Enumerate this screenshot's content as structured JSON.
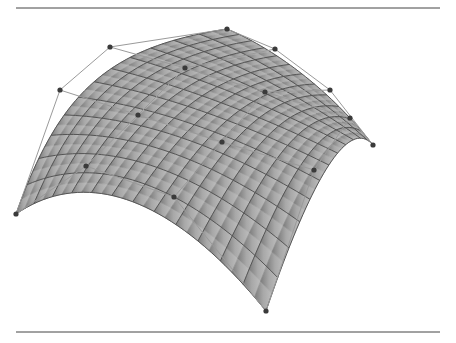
{
  "figure": {
    "rules": {
      "top_y": 8,
      "bottom_y": 332,
      "x1": 16,
      "x2": 440,
      "color": "#444444"
    },
    "colors": {
      "surface": "#a8a8a8",
      "surface_dark": "#7c7c7c",
      "grid": "#555555",
      "net": "#9a9a9a",
      "point": "#3a3a3a"
    },
    "control_net": [
      [
        [
          16,
          214
        ],
        [
          86,
          166
        ],
        [
          174,
          197
        ],
        [
          266,
          311
        ]
      ],
      [
        [
          60,
          90
        ],
        [
          138,
          115
        ],
        [
          222,
          142
        ],
        [
          314,
          170
        ]
      ],
      [
        [
          110,
          47
        ],
        [
          185,
          68
        ],
        [
          265,
          92
        ],
        [
          350,
          118
        ]
      ],
      [
        [
          227,
          29
        ],
        [
          275,
          49
        ],
        [
          330,
          90
        ],
        [
          373,
          145
        ]
      ]
    ],
    "grid_divisions": 12
  }
}
